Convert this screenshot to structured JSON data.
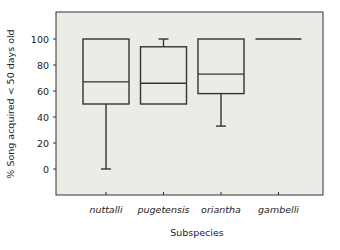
{
  "chart_data": {
    "type": "box",
    "title": "",
    "xlabel": "Subspecies",
    "ylabel": "% Song acquired < 50 days old",
    "categories": [
      "nuttalli",
      "pugetensis",
      "oriantha",
      "gambelli"
    ],
    "yticks": [
      0,
      20,
      40,
      60,
      80,
      100
    ],
    "ylim": [
      -20,
      120
    ],
    "grid": false,
    "legend": null,
    "boxes": [
      {
        "name": "nuttalli",
        "min": 0,
        "q1": 50,
        "median": 67,
        "q3": 100,
        "max": 100
      },
      {
        "name": "pugetensis",
        "min": 50,
        "q1": 50,
        "median": 66,
        "q3": 94,
        "max": 100
      },
      {
        "name": "oriantha",
        "min": 33,
        "q1": 58,
        "median": 73,
        "q3": 100,
        "max": 100
      },
      {
        "name": "gambelli",
        "min": 100,
        "q1": 100,
        "median": 100,
        "q3": 100,
        "max": 100
      }
    ]
  },
  "colors": {
    "plot_background": "#ebece6",
    "line": "#333333",
    "text": "#222222"
  }
}
